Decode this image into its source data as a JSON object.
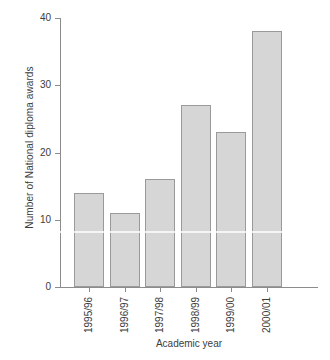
{
  "chart_data": {
    "type": "bar",
    "title": "",
    "subtitle": "",
    "xlabel": "Academic year",
    "ylabel": "Number of National diploma awards",
    "categories": [
      "1995/96",
      "1996/97",
      "1997/98",
      "1998/99",
      "1999/00",
      "2000/01"
    ],
    "values": [
      14,
      11,
      16,
      27,
      23,
      38
    ],
    "series": [
      {
        "name": "National diploma awards",
        "values": [
          14,
          11,
          16,
          27,
          23,
          38
        ]
      }
    ],
    "ylim": [
      0,
      40
    ],
    "y_ticks": [
      0,
      10,
      20,
      30,
      40
    ],
    "y_tick_labels": [
      "0",
      "10",
      "20",
      "30",
      "40"
    ],
    "grid": false,
    "legend": false,
    "legend_position": "none",
    "bar_fill_color": "#d6d6d6",
    "bar_border_color": "#9a9a9a",
    "axis_color": "#8c8c8c",
    "text_color": "#3c3c3c",
    "background_color": "#ffffff",
    "category_label_rotation": -90
  }
}
